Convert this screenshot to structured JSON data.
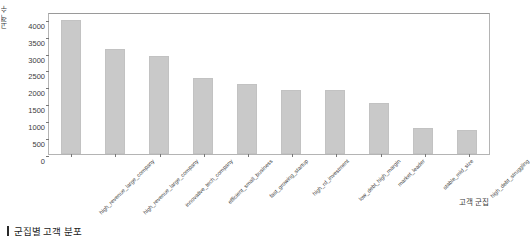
{
  "caption": {
    "marker": "vertical-bar",
    "text": "군집별 고객 분포"
  },
  "chart_data": {
    "type": "bar",
    "title": "",
    "xlabel": "고객 군집",
    "ylabel": "고객 수",
    "ylim": [
      0,
      4200
    ],
    "yticks": [
      0,
      500,
      1000,
      1500,
      2000,
      2500,
      3000,
      3500,
      4000
    ],
    "ytick_labels": [
      "0",
      "500",
      "1000",
      "1500",
      "2000",
      "2500",
      "3000",
      "3500",
      "4000"
    ],
    "grid": false,
    "legend": null,
    "bar_color": "#c9c9c9",
    "categories": [
      "high_revenue_large_company",
      "high_revenue_large_company",
      "innovative_tech_company",
      "efficient_small_business",
      "fast_growing_startup",
      "high_rd_investment",
      "low_debt_high_margin",
      "market_leader",
      "stable_mid_size",
      "high_debt_struggling"
    ],
    "values": [
      3950,
      3120,
      2900,
      2250,
      2080,
      1900,
      1880,
      1520,
      780,
      720
    ]
  }
}
